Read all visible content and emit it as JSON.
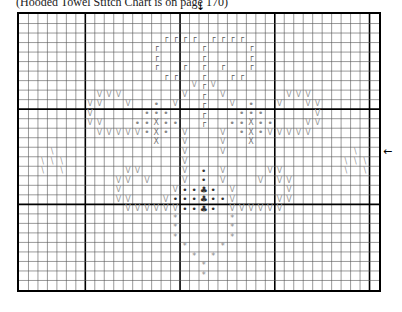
{
  "caption": "(Hooded Towel Stitch Chart is on page 170)",
  "chart": {
    "columns": 38,
    "rows": 29,
    "major_every": 10,
    "major_col_offset": 7,
    "major_row_offset": 0,
    "center_column_arrow": "↓",
    "center_row_arrow": "←",
    "symbols": {
      "r": "┌",
      "v": "V",
      "dot": "•",
      "x": "X",
      "bk": "\\",
      "club": "♣",
      "bdot": "•",
      "star": "*"
    },
    "cells": [
      [
        "r",
        2,
        15
      ],
      [
        "r",
        2,
        16
      ],
      [
        "r",
        2,
        17
      ],
      [
        "r",
        2,
        18
      ],
      [
        "r",
        2,
        20
      ],
      [
        "r",
        2,
        21
      ],
      [
        "r",
        2,
        22
      ],
      [
        "r",
        2,
        23
      ],
      [
        "r",
        3,
        14
      ],
      [
        "r",
        3,
        19
      ],
      [
        "r",
        3,
        24
      ],
      [
        "r",
        4,
        14
      ],
      [
        "r",
        4,
        19
      ],
      [
        "r",
        4,
        24
      ],
      [
        "r",
        5,
        14
      ],
      [
        "r",
        5,
        17
      ],
      [
        "r",
        5,
        19
      ],
      [
        "r",
        5,
        21
      ],
      [
        "r",
        5,
        24
      ],
      [
        "r",
        6,
        15
      ],
      [
        "r",
        6,
        16
      ],
      [
        "r",
        6,
        19
      ],
      [
        "r",
        6,
        22
      ],
      [
        "r",
        6,
        23
      ],
      [
        "v",
        7,
        18
      ],
      [
        "r",
        7,
        19
      ],
      [
        "v",
        7,
        20
      ],
      [
        "v",
        8,
        8
      ],
      [
        "v",
        8,
        9
      ],
      [
        "v",
        8,
        10
      ],
      [
        "v",
        8,
        17
      ],
      [
        "r",
        8,
        19
      ],
      [
        "v",
        8,
        21
      ],
      [
        "v",
        8,
        28
      ],
      [
        "v",
        8,
        29
      ],
      [
        "v",
        8,
        30
      ],
      [
        "v",
        9,
        7
      ],
      [
        "v",
        9,
        8
      ],
      [
        "v",
        9,
        11
      ],
      [
        "dot",
        9,
        14
      ],
      [
        "v",
        9,
        16
      ],
      [
        "r",
        9,
        19
      ],
      [
        "v",
        9,
        22
      ],
      [
        "dot",
        9,
        24
      ],
      [
        "v",
        9,
        27
      ],
      [
        "v",
        9,
        30
      ],
      [
        "v",
        9,
        31
      ],
      [
        "v",
        10,
        7
      ],
      [
        "dot",
        10,
        13
      ],
      [
        "dot",
        10,
        14
      ],
      [
        "dot",
        10,
        15
      ],
      [
        "r",
        10,
        19
      ],
      [
        "dot",
        10,
        23
      ],
      [
        "dot",
        10,
        24
      ],
      [
        "dot",
        10,
        25
      ],
      [
        "v",
        10,
        31
      ],
      [
        "v",
        11,
        7
      ],
      [
        "v",
        11,
        8
      ],
      [
        "dot",
        11,
        12
      ],
      [
        "dot",
        11,
        13
      ],
      [
        "x",
        11,
        14
      ],
      [
        "dot",
        11,
        15
      ],
      [
        "dot",
        11,
        16
      ],
      [
        "r",
        11,
        19
      ],
      [
        "dot",
        11,
        22
      ],
      [
        "dot",
        11,
        23
      ],
      [
        "x",
        11,
        24
      ],
      [
        "dot",
        11,
        25
      ],
      [
        "dot",
        11,
        26
      ],
      [
        "v",
        11,
        30
      ],
      [
        "v",
        11,
        31
      ],
      [
        "v",
        12,
        8
      ],
      [
        "v",
        12,
        9
      ],
      [
        "v",
        12,
        10
      ],
      [
        "v",
        12,
        11
      ],
      [
        "v",
        12,
        12
      ],
      [
        "dot",
        12,
        13
      ],
      [
        "x",
        12,
        14
      ],
      [
        "dot",
        12,
        15
      ],
      [
        "v",
        12,
        17
      ],
      [
        "v",
        12,
        21
      ],
      [
        "dot",
        12,
        23
      ],
      [
        "x",
        12,
        24
      ],
      [
        "dot",
        12,
        25
      ],
      [
        "v",
        12,
        26
      ],
      [
        "v",
        12,
        27
      ],
      [
        "v",
        12,
        28
      ],
      [
        "v",
        12,
        29
      ],
      [
        "v",
        12,
        30
      ],
      [
        "x",
        13,
        14
      ],
      [
        "v",
        13,
        17
      ],
      [
        "v",
        13,
        21
      ],
      [
        "x",
        13,
        24
      ],
      [
        "bk",
        14,
        3
      ],
      [
        "v",
        14,
        17
      ],
      [
        "v",
        14,
        21
      ],
      [
        "bk",
        14,
        35
      ],
      [
        "bk",
        15,
        2
      ],
      [
        "bk",
        15,
        3
      ],
      [
        "bk",
        15,
        4
      ],
      [
        "v",
        15,
        17
      ],
      [
        "bk",
        15,
        34
      ],
      [
        "bk",
        15,
        35
      ],
      [
        "bk",
        15,
        36
      ],
      [
        "bk",
        16,
        2
      ],
      [
        "bk",
        16,
        4
      ],
      [
        "v",
        16,
        11
      ],
      [
        "v",
        16,
        12
      ],
      [
        "v",
        16,
        17
      ],
      [
        "bdot",
        16,
        19
      ],
      [
        "v",
        16,
        21
      ],
      [
        "v",
        16,
        26
      ],
      [
        "v",
        16,
        27
      ],
      [
        "bk",
        16,
        34
      ],
      [
        "bk",
        16,
        36
      ],
      [
        "v",
        17,
        10
      ],
      [
        "v",
        17,
        11
      ],
      [
        "v",
        17,
        13
      ],
      [
        "v",
        17,
        17
      ],
      [
        "bdot",
        17,
        19
      ],
      [
        "v",
        17,
        21
      ],
      [
        "v",
        17,
        25
      ],
      [
        "v",
        17,
        27
      ],
      [
        "v",
        17,
        28
      ],
      [
        "v",
        18,
        10
      ],
      [
        "v",
        18,
        16
      ],
      [
        "bdot",
        18,
        17
      ],
      [
        "bdot",
        18,
        18
      ],
      [
        "club",
        18,
        19
      ],
      [
        "bdot",
        18,
        20
      ],
      [
        "v",
        18,
        22
      ],
      [
        "v",
        18,
        28
      ],
      [
        "v",
        19,
        10
      ],
      [
        "v",
        19,
        11
      ],
      [
        "v",
        19,
        15
      ],
      [
        "bdot",
        19,
        16
      ],
      [
        "bdot",
        19,
        17
      ],
      [
        "bdot",
        19,
        18
      ],
      [
        "club",
        19,
        19
      ],
      [
        "bdot",
        19,
        20
      ],
      [
        "bdot",
        19,
        21
      ],
      [
        "v",
        19,
        22
      ],
      [
        "v",
        19,
        27
      ],
      [
        "v",
        19,
        28
      ],
      [
        "v",
        20,
        11
      ],
      [
        "v",
        20,
        12
      ],
      [
        "v",
        20,
        13
      ],
      [
        "v",
        20,
        14
      ],
      [
        "v",
        20,
        15
      ],
      [
        "v",
        20,
        16
      ],
      [
        "bdot",
        20,
        17
      ],
      [
        "bdot",
        20,
        18
      ],
      [
        "club",
        20,
        19
      ],
      [
        "bdot",
        20,
        20
      ],
      [
        "v",
        20,
        22
      ],
      [
        "v",
        20,
        23
      ],
      [
        "v",
        20,
        24
      ],
      [
        "v",
        20,
        25
      ],
      [
        "v",
        20,
        26
      ],
      [
        "v",
        20,
        27
      ],
      [
        "star",
        21,
        16
      ],
      [
        "star",
        21,
        22
      ],
      [
        "star",
        22,
        16
      ],
      [
        "star",
        22,
        22
      ],
      [
        "star",
        23,
        16
      ],
      [
        "star",
        23,
        22
      ],
      [
        "star",
        24,
        17
      ],
      [
        "star",
        24,
        21
      ],
      [
        "star",
        25,
        18
      ],
      [
        "star",
        25,
        20
      ],
      [
        "star",
        26,
        19
      ],
      [
        "star",
        27,
        19
      ]
    ]
  }
}
